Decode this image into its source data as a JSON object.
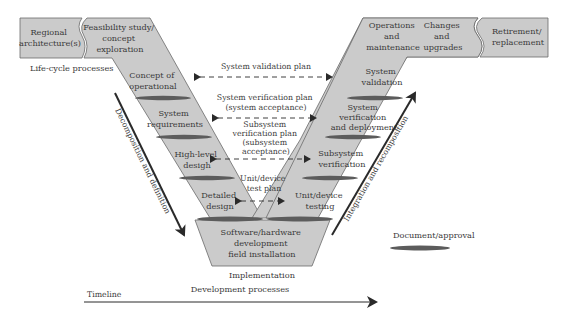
{
  "diagram": {
    "type": "V-model systems engineering life cycle",
    "colors": {
      "box_fill": "#cbcbcb",
      "box_stroke": "#6a6a6a",
      "ellipse_fill": "#5c5c5c",
      "text": "#3a3a3a",
      "arrow": "#2a2a2a"
    },
    "top_left": {
      "regional": [
        "Regional",
        "architecture(s)"
      ],
      "feasibility": [
        "Feasibility study/",
        "concept",
        "exploration"
      ],
      "caption": "Life-cycle processes"
    },
    "top_right": {
      "operations": [
        "Operations",
        "and",
        "maintenance"
      ],
      "changes": [
        "Changes",
        "and",
        "upgrades"
      ],
      "retirement": [
        "Retirement/",
        "replacement"
      ]
    },
    "left_leg": [
      [
        "Concept of",
        "operational"
      ],
      [
        "System",
        "requirements"
      ],
      [
        "High-level",
        "desigh"
      ],
      [
        "Detailed",
        "design"
      ]
    ],
    "right_leg": [
      [
        "System",
        "validation"
      ],
      [
        "System",
        "verification",
        "and deployment"
      ],
      [
        "Subsystem",
        "verification"
      ],
      [
        "Unit/device",
        "testing"
      ]
    ],
    "bottom": {
      "box": [
        "Software/hardware",
        "development",
        "field installation"
      ],
      "caption": "Implementation"
    },
    "plans": [
      [
        "System validation plan"
      ],
      [
        "System verification plan",
        "(system acceptance)"
      ],
      [
        "Subsystem",
        "verification plan",
        "(subsystem",
        "acceptance)"
      ],
      [
        "Unit/device",
        "test plan"
      ]
    ],
    "side_arrows": {
      "left": "Decomposition and definition",
      "right": "Integration and recomposition"
    },
    "legend": {
      "label": "Document/approval"
    },
    "footer": {
      "development": "Development processes",
      "timeline": "Timeline"
    }
  }
}
